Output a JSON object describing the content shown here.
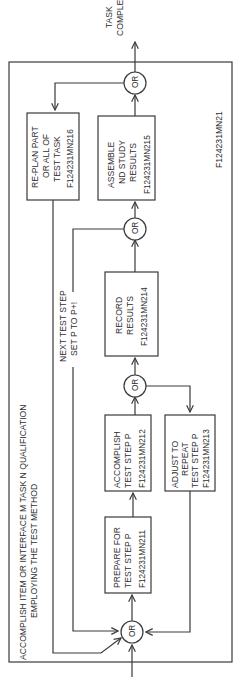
{
  "diagram": {
    "title_line1": "ACCOMPLISH ITEM OR INTERFACE M TASK N QUALIFICATION",
    "title_line2": "EMPLOYING THE TEST METHOD",
    "figure_id": "F124231MN21",
    "output_label_line1": "TASK",
    "output_label_line2": "COMPLETE",
    "loop_label_line1": "NEXT TEST STEP",
    "loop_label_line2": "SET P TO P+!",
    "or_label": "OR",
    "boxes": [
      {
        "id": "prepare",
        "lines": [
          "PREPARE FOR",
          "TEST STEP P"
        ],
        "code": "F124231MN211"
      },
      {
        "id": "accomplish",
        "lines": [
          "ACCOMPLISH",
          "TEST STEP P"
        ],
        "code": "F124231MN212"
      },
      {
        "id": "adjust",
        "lines": [
          "ADJUST TO",
          "REPEAT",
          "TEST STEP P"
        ],
        "code": "F124231MN213"
      },
      {
        "id": "record",
        "lines": [
          "RECORD",
          "RESULTS"
        ],
        "code": "F124231MN214"
      },
      {
        "id": "assemble",
        "lines": [
          "ASSEMBLE",
          "ND STUDY",
          "RESULTS"
        ],
        "code": "F124231MN215"
      },
      {
        "id": "replan",
        "lines": [
          "RE-PLAN PART",
          "OR ALL OF",
          "TEST TASK"
        ],
        "code": "F124231MN216"
      }
    ],
    "colors": {
      "line": "#3a3a3a",
      "text": "#2e2e2e",
      "background": "#ffffff"
    }
  }
}
